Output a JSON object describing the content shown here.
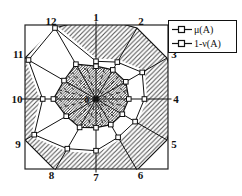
{
  "figure": {
    "type_label": "radar-diagram",
    "center_label": "0"
  },
  "legend": {
    "items": [
      {
        "label": "μ(A)",
        "marker": "square-marker"
      },
      {
        "label": "1-ν(A)",
        "marker": "square-marker"
      }
    ]
  },
  "colors": {
    "line": "#111111",
    "frame": "#222222",
    "light_hatch": "#555555",
    "dark_hatch": "#1e1e1e",
    "marker_fill": "#ffffff",
    "background": "#ffffff"
  },
  "chart_data": {
    "type": "radar",
    "categories": [
      "1",
      "2",
      "3",
      "4",
      "5",
      "6",
      "7",
      "8",
      "9",
      "10",
      "11",
      "12"
    ],
    "series": [
      {
        "name": "μ(A)",
        "values": [
          0.4,
          0.41,
          0.42,
          0.4,
          0.37,
          0.36,
          0.35,
          0.4,
          0.42,
          0.52,
          0.45,
          0.49
        ],
        "style": "dense-hatch-polygon",
        "marker": "square"
      },
      {
        "name": "1-ν(A)",
        "values": [
          0.46,
          0.52,
          0.65,
          0.59,
          0.55,
          0.54,
          0.63,
          0.7,
          0.87,
          0.65,
          0.95,
          1.0
        ],
        "style": "light-hatch-band-to-rim",
        "marker": "square"
      }
    ],
    "rmax": 1.0,
    "start_axis": "top",
    "direction": "clockwise",
    "center_label": "0",
    "legend_position": "top-right",
    "grid": false,
    "frame": "square-border"
  }
}
